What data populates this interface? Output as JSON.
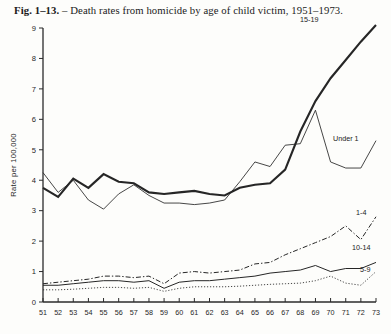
{
  "figure": {
    "number": "Fig. 1–13.",
    "dash": " – ",
    "caption": "Death rates from homicide by age of child victim, 1951–1973."
  },
  "chart_data": {
    "type": "line",
    "title": "Fig. 1–13. – Death rates from homicide by age of child victim, 1951–1973.",
    "xlabel": "",
    "ylabel": "Rate per 100,000",
    "xlim": [
      51,
      73
    ],
    "ylim": [
      0,
      9
    ],
    "grid": false,
    "legend_position": "inline-right",
    "x": [
      51,
      52,
      53,
      54,
      55,
      56,
      57,
      58,
      59,
      60,
      61,
      62,
      63,
      64,
      65,
      66,
      67,
      68,
      69,
      70,
      71,
      72,
      73
    ],
    "xtick_labels": [
      "51",
      "52",
      "53",
      "54",
      "55",
      "56",
      "57",
      "58",
      "59",
      "60",
      "61",
      "62",
      "63",
      "64",
      "65",
      "66",
      "67",
      "68",
      "69",
      "70",
      "71",
      "72",
      "73"
    ],
    "ytick_labels": [
      "0",
      "1",
      "2",
      "3",
      "4",
      "5",
      "6",
      "7",
      "8",
      "9"
    ],
    "series": [
      {
        "name": "15-19",
        "label": "15-19",
        "style": "solid-thick",
        "values": [
          3.75,
          3.45,
          4.05,
          3.75,
          4.2,
          3.95,
          3.9,
          3.6,
          3.55,
          3.6,
          3.65,
          3.55,
          3.5,
          3.75,
          3.85,
          3.9,
          4.35,
          5.6,
          6.6,
          7.35,
          7.95,
          8.55,
          9.1
        ]
      },
      {
        "name": "Under 1",
        "label": "Under 1",
        "style": "solid-thin",
        "values": [
          4.25,
          3.6,
          4.0,
          3.35,
          3.05,
          3.55,
          3.85,
          3.5,
          3.25,
          3.25,
          3.2,
          3.25,
          3.35,
          3.95,
          4.6,
          4.45,
          5.15,
          5.2,
          6.3,
          4.6,
          4.4,
          4.4,
          5.3
        ]
      },
      {
        "name": "1-4",
        "label": "1-4",
        "style": "dash-dot",
        "values": [
          0.6,
          0.65,
          0.7,
          0.75,
          0.85,
          0.85,
          0.8,
          0.85,
          0.6,
          0.95,
          1.0,
          0.95,
          1.0,
          1.05,
          1.25,
          1.3,
          1.55,
          1.75,
          1.95,
          2.15,
          2.5,
          2.05,
          2.8
        ]
      },
      {
        "name": "10-14",
        "label": "10-14",
        "style": "solid-mid",
        "values": [
          0.55,
          0.55,
          0.6,
          0.65,
          0.7,
          0.7,
          0.65,
          0.7,
          0.45,
          0.65,
          0.7,
          0.7,
          0.75,
          0.8,
          0.85,
          0.95,
          1.0,
          1.05,
          1.2,
          1.0,
          1.1,
          1.1,
          1.3
        ]
      },
      {
        "name": "5-9",
        "label": "5-9",
        "style": "dotted",
        "values": [
          0.4,
          0.4,
          0.42,
          0.45,
          0.48,
          0.48,
          0.45,
          0.48,
          0.35,
          0.45,
          0.5,
          0.5,
          0.5,
          0.52,
          0.55,
          0.58,
          0.6,
          0.62,
          0.7,
          0.85,
          0.62,
          0.55,
          1.0
        ]
      }
    ]
  }
}
